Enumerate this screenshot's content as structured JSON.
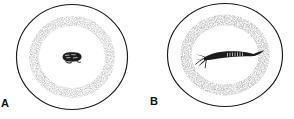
{
  "figure": {
    "background_color": "#ffffff",
    "ink_color": "#1a1a1a",
    "stipple_color": "#4a4a4a",
    "width": 294,
    "height": 119,
    "panels": [
      {
        "id": "a",
        "label": "A",
        "shape": "ovum-outline",
        "outline_description": "rounded ovoid egg outline drawn as a thin closed line",
        "texture": "radial stipple dense at periphery fading toward centre",
        "center_structure": {
          "name": "blastodisc",
          "description": "small dark compact oval germinal disc at the centre of the yolk",
          "shape": "compact-oval-blob"
        },
        "bounds": {
          "cx": 72,
          "cy": 57,
          "rx": 56,
          "ry": 53
        }
      },
      {
        "id": "b",
        "label": "B",
        "shape": "ovum-outline",
        "outline_description": "rounded ovoid egg outline drawn as a thin closed line",
        "texture": "radial stipple dense at periphery fading toward centre",
        "center_structure": {
          "name": "elongated-embryo",
          "description": "elongated dark embryo lying across the centre with a forked branching tail at the left end and a tapering pointed head at the right end",
          "shape": "elongated-forked-embryo"
        },
        "bounds": {
          "cx": 78,
          "cy": 55,
          "rx": 58,
          "ry": 52
        }
      }
    ]
  }
}
